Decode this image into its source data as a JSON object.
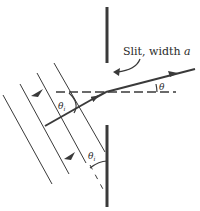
{
  "diagram": {
    "labels": {
      "slit": "Slit, width ",
      "slit_var": "a",
      "theta": "θ",
      "theta_i_upper": "θ",
      "theta_i_upper_sub": "i",
      "theta_i_lower": "θ",
      "theta_i_lower_sub": "i"
    },
    "elements": [
      "top-barrier",
      "bottom-barrier",
      "normal-dashed-line",
      "incident-wavefronts",
      "incident-ray",
      "diffracted-ray",
      "slit-pointer-arrow"
    ],
    "colors": {
      "line": "#3a3a3a",
      "text": "#2a2a2a",
      "background": "#ffffff"
    }
  }
}
